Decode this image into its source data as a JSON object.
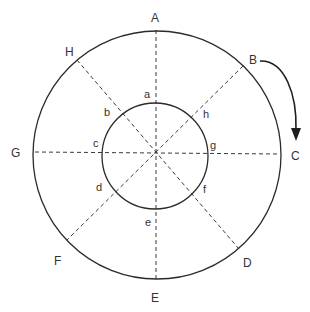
{
  "diagram": {
    "outer_labels": {
      "A": "A",
      "B": "B",
      "C": "C",
      "D": "D",
      "E": "E",
      "F": "F",
      "G": "G",
      "H": "H"
    },
    "inner_labels": {
      "a": "a",
      "b": "b",
      "c": "c",
      "d": "d",
      "e": "e",
      "f": "f",
      "g": "g",
      "h": "h"
    },
    "rotation_arrow": {
      "from": "B",
      "to": "C",
      "direction": "clockwise"
    },
    "colors": {
      "line": "#2b2b2b",
      "background": "#ffffff"
    }
  }
}
